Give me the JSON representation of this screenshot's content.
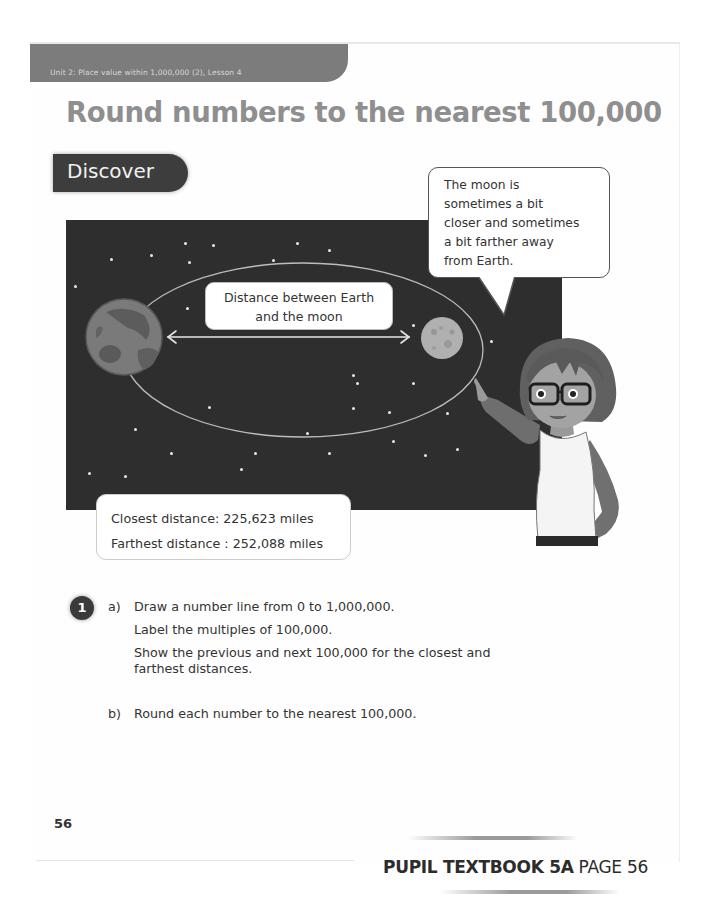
{
  "header": {
    "unit_banner": "Unit 2: Place value within 1,000,000 (2), Lesson 4",
    "lesson_title": "Round numbers to the nearest 100,000"
  },
  "section": {
    "tab_label": "Discover"
  },
  "illustration": {
    "distance_label_line1": "Distance between Earth",
    "distance_label_line2": "and the moon",
    "speech_bubble": {
      "lines": [
        "The moon is",
        "sometimes a bit",
        "closer and sometimes",
        "a bit farther away",
        "from Earth."
      ]
    },
    "distances": {
      "closest": "Closest distance: 225,623 miles",
      "farthest": "Farthest distance : 252,088 miles"
    },
    "icons": [
      "earth-icon",
      "moon-icon",
      "double-arrow-icon",
      "orbit-ellipse",
      "teacher-character"
    ]
  },
  "question": {
    "number": "1",
    "part_a": {
      "letter": "a)",
      "lines": [
        "Draw a number line from 0 to 1,000,000.",
        "Label the multiples of 100,000.",
        "Show the previous and next 100,000 for the closest and farthest distances."
      ]
    },
    "part_b": {
      "letter": "b)",
      "lines": [
        "Round each number to the nearest 100,000."
      ]
    }
  },
  "footer": {
    "page_number": "56",
    "book_ref": "PUPIL TEXTBOOK 5A",
    "book_page": "PAGE 56"
  },
  "colors": {
    "banner": "#7c7c7c",
    "title": "#8f8f8f",
    "tab": "#3d3d3d",
    "space": "#2e2e2e",
    "text": "#333333"
  }
}
